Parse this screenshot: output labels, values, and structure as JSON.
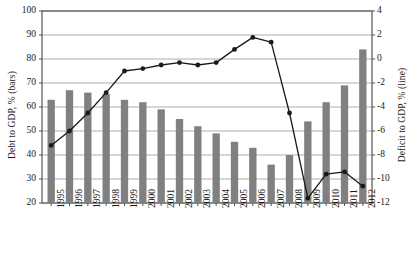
{
  "chart_data": {
    "type": "bar",
    "title": "",
    "subtitle": "",
    "xlabel": "",
    "grid": true,
    "legend_position": "none",
    "categories": [
      "1995",
      "1996",
      "1997",
      "1998",
      "1999",
      "2000",
      "2001",
      "2002",
      "2003",
      "2004",
      "2005",
      "2006",
      "2007",
      "2008",
      "2009",
      "2010",
      "2011",
      "2012"
    ],
    "series": [
      {
        "name": "Debt to GDP, % (bars)",
        "type": "bar",
        "axis": "left",
        "color": "#808080",
        "values": [
          63,
          67,
          66,
          65.5,
          63,
          62,
          59,
          55,
          52,
          49,
          45.5,
          43,
          36,
          40,
          54,
          62,
          69,
          84
        ]
      },
      {
        "name": "Deficit to GDP, % (line)",
        "type": "line",
        "axis": "right",
        "color": "#1a1a1a",
        "values": [
          -7.2,
          -6.0,
          -4.5,
          -2.8,
          -1.0,
          -0.8,
          -0.5,
          -0.3,
          -0.5,
          -0.3,
          0.8,
          1.8,
          1.4,
          -4.5,
          -11.6,
          -9.6,
          -9.4,
          -10.6
        ]
      }
    ],
    "left_axis": {
      "label": "Debt to GDP, % (bars)",
      "ylim": [
        20,
        100
      ],
      "ticks": [
        20,
        30,
        40,
        50,
        60,
        70,
        80,
        90,
        100
      ]
    },
    "right_axis": {
      "label": "Deficit to GDP, % (line)",
      "ylim": [
        -12,
        4
      ],
      "ticks": [
        -12,
        -10,
        -8,
        -6,
        -4,
        -2,
        0,
        2,
        4
      ]
    }
  },
  "colors": {
    "bar": "#808080",
    "line": "#1a1a1a",
    "grid": "#999999",
    "frame": "#555555",
    "text": "#1a1a1a",
    "background": "#ffffff"
  }
}
